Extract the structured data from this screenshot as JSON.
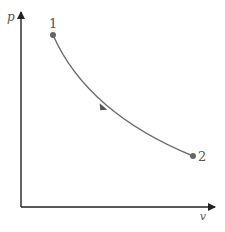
{
  "diagram": {
    "type": "p-v process",
    "y_axis_label": "p",
    "x_axis_label": "v",
    "states": [
      {
        "label": "1"
      },
      {
        "label": "2"
      }
    ],
    "process_direction": "1 to 2",
    "colors": {
      "axis": "#222222",
      "curve": "#6b6b6b",
      "point": "#666666",
      "text": "#555555"
    }
  }
}
